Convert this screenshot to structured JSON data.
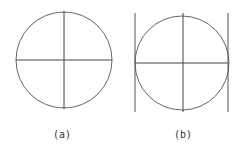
{
  "figures": [
    {
      "id": "a",
      "label": "(a)",
      "circle": {
        "cx": 64,
        "cy": 60,
        "r": 48
      },
      "horizontal_line": {
        "x1": 16,
        "x2": 112,
        "y": 60
      },
      "vertical_line": {
        "x": 64,
        "y1": 11,
        "y2": 109
      },
      "tangent_lines": []
    },
    {
      "id": "b",
      "label": "(b)",
      "circle": {
        "cx": 182,
        "cy": 63,
        "r": 47
      },
      "horizontal_line": {
        "x1": 135,
        "x2": 228,
        "y": 63
      },
      "vertical_line": {
        "x": 183,
        "y1": 13,
        "y2": 112
      },
      "tangent_lines": [
        {
          "x": 135,
          "y1": 13,
          "y2": 112
        },
        {
          "x": 228,
          "y1": 13,
          "y2": 112
        }
      ]
    }
  ],
  "stroke_color": "#555555"
}
